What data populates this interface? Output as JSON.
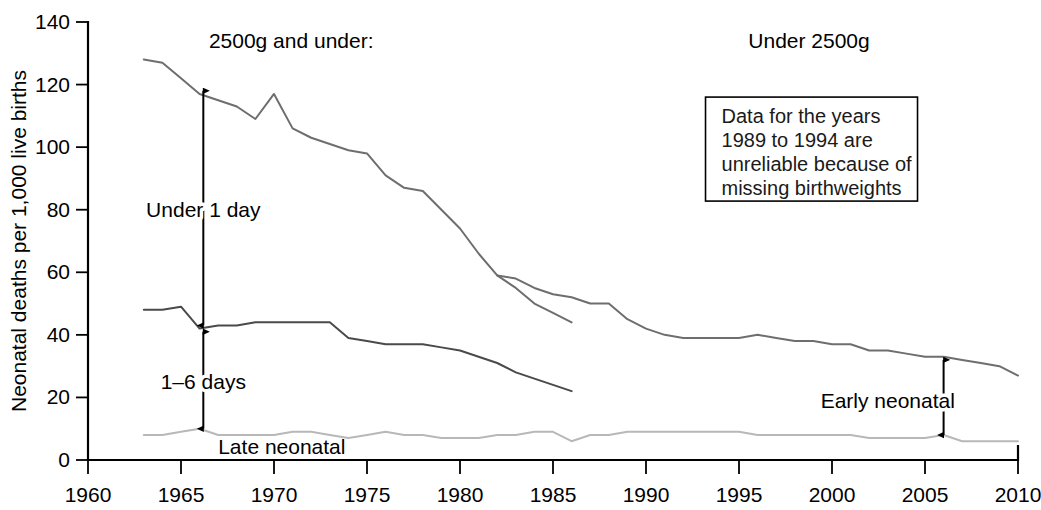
{
  "chart_data": {
    "type": "line",
    "title": "",
    "xlabel": "",
    "ylabel": "Neonatal deaths per 1,000 live births",
    "xlim": [
      1960,
      2010
    ],
    "ylim": [
      0,
      140
    ],
    "xticks": [
      1960,
      1965,
      1970,
      1975,
      1980,
      1985,
      1990,
      1995,
      2000,
      2005,
      2010
    ],
    "yticks": [
      0,
      20,
      40,
      60,
      80,
      100,
      120,
      140
    ],
    "grid": false,
    "legend_position": "inline-annotations",
    "series": [
      {
        "name": "Under 1 day",
        "color": "#6e6e6e",
        "segments": [
          {
            "label": "2500g and under",
            "x": [
              1963,
              1964,
              1965,
              1966,
              1967,
              1968,
              1969,
              1970,
              1971,
              1972,
              1973,
              1974,
              1975,
              1976,
              1977,
              1978,
              1979,
              1980,
              1981,
              1982,
              1983,
              1984,
              1985,
              1986
            ],
            "y": [
              128,
              127,
              122,
              117,
              115,
              113,
              109,
              117,
              106,
              103,
              101,
              99,
              98,
              91,
              87,
              86,
              80,
              74,
              66,
              59,
              55,
              50,
              47,
              44
            ]
          },
          {
            "label": "Under 2500g",
            "x": [
              1982,
              1983,
              1984,
              1985,
              1986,
              1987,
              1988,
              1989,
              1990,
              1991,
              1992,
              1993,
              1994,
              1995,
              1996,
              1997,
              1998,
              1999,
              2000,
              2001,
              2002,
              2003,
              2004,
              2005,
              2006,
              2007,
              2008,
              2009,
              2010
            ],
            "y": [
              59,
              58,
              55,
              53,
              52,
              50,
              50,
              45,
              42,
              40,
              39,
              39,
              39,
              39,
              40,
              39,
              38,
              38,
              37,
              37,
              35,
              35,
              34,
              33,
              33,
              32,
              31,
              30,
              27
            ]
          }
        ]
      },
      {
        "name": "1-6 days",
        "color": "#4a4a4a",
        "segments": [
          {
            "label": "2500g and under",
            "x": [
              1963,
              1964,
              1965,
              1966,
              1967,
              1968,
              1969,
              1970,
              1971,
              1972,
              1973,
              1974,
              1975,
              1976,
              1977,
              1978,
              1979,
              1980,
              1981,
              1982,
              1983,
              1984,
              1985,
              1986
            ],
            "y": [
              48,
              48,
              49,
              42,
              43,
              43,
              44,
              44,
              44,
              44,
              44,
              39,
              38,
              37,
              37,
              37,
              36,
              35,
              33,
              31,
              28,
              26,
              24,
              22
            ]
          }
        ]
      },
      {
        "name": "Late neonatal",
        "color": "#b8b8b8",
        "segments": [
          {
            "label": "2500g and under / Under 2500g",
            "x": [
              1963,
              1964,
              1965,
              1966,
              1967,
              1968,
              1969,
              1970,
              1971,
              1972,
              1973,
              1974,
              1975,
              1976,
              1977,
              1978,
              1979,
              1980,
              1981,
              1982,
              1983,
              1984,
              1985,
              1986,
              1987,
              1988,
              1989,
              1990,
              1991,
              1992,
              1993,
              1994,
              1995,
              1996,
              1997,
              1998,
              1999,
              2000,
              2001,
              2002,
              2003,
              2004,
              2005,
              2006,
              2007,
              2008,
              2009,
              2010
            ],
            "y": [
              8,
              8,
              9,
              10,
              8,
              8,
              8,
              8,
              9,
              9,
              8,
              7,
              8,
              9,
              8,
              8,
              7,
              7,
              7,
              8,
              8,
              9,
              9,
              6,
              8,
              8,
              9,
              9,
              9,
              9,
              9,
              9,
              9,
              8,
              8,
              8,
              8,
              8,
              8,
              7,
              7,
              7,
              7,
              8,
              6,
              6,
              6,
              6
            ]
          }
        ]
      }
    ],
    "annotations": [
      {
        "id": "group-left",
        "text": "2500g and under:",
        "x_year": 1966.5,
        "y_value": 134
      },
      {
        "id": "group-right",
        "text": "Under 2500g",
        "x_year": 1995.5,
        "y_value": 134
      },
      {
        "id": "band-under1",
        "text": "Under 1 day",
        "x_year": 1966.2,
        "y_value": 80
      },
      {
        "id": "band-1to6",
        "text": "1–6 days",
        "x_year": 1966.2,
        "y_value": 25
      },
      {
        "id": "band-late",
        "text": "Late neonatal",
        "x_year": 1967.0,
        "y_value": 4
      },
      {
        "id": "band-early",
        "text": "Early neonatal",
        "x_year": 2003.0,
        "y_value": 19
      }
    ],
    "arrows": [
      {
        "id": "arrow-under1",
        "x_year": 1966.2,
        "y_from": 118,
        "y_to": 43,
        "heads": "both"
      },
      {
        "id": "arrow-1to6",
        "x_year": 1966.2,
        "y_from": 41,
        "y_to": 10,
        "heads": "both"
      },
      {
        "id": "arrow-early",
        "x_year": 2006.0,
        "y_from": 32,
        "y_to": 8,
        "heads": "both"
      }
    ],
    "note_box": {
      "lines": [
        "Data for the years",
        "1989 to 1994 are",
        "unreliable because of",
        "missing birthweights"
      ],
      "x_year": 1993.2,
      "y_value": 116
    }
  }
}
